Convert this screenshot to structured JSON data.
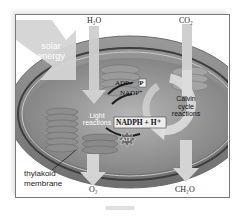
{
  "diagram": {
    "inputs": [
      {
        "id": "solar",
        "label_line1": "solar",
        "label_line2": "energy"
      },
      {
        "id": "water",
        "label": "H₂O"
      },
      {
        "id": "co2",
        "label": "CO₂"
      }
    ],
    "outputs": [
      {
        "id": "o2",
        "label": "O₂"
      },
      {
        "id": "sugar",
        "label": "CH₂O"
      }
    ],
    "stages": {
      "light": {
        "line1": "Light",
        "line2": "reactions"
      },
      "calvin": {
        "line1": "Calvin",
        "line2": "cycle",
        "line3": "reactions"
      }
    },
    "cycle_molecules": {
      "adp": "ADP + ",
      "pi": "P",
      "nadp": "NADP⁺",
      "nadph": "NADPH + H⁺",
      "atp": "ATP"
    },
    "structure_label": {
      "line1": "thylakoid",
      "line2": "membrane"
    },
    "colors": {
      "frame_border": "#7a7a7a",
      "stroma": "#8c8c8c",
      "outer_membrane": "#5a5a5a",
      "arrow": "#d4d4d4",
      "text_dark": "#222222",
      "text_light": "#ffffff"
    }
  }
}
